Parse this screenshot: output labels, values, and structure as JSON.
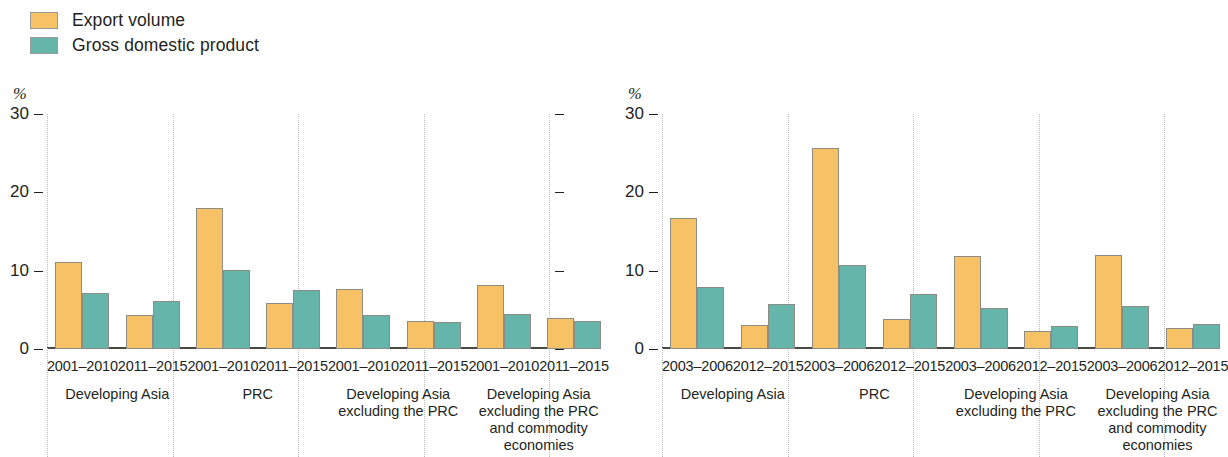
{
  "legend": {
    "items": [
      {
        "label": "Export volume",
        "color": "#f6c265",
        "key": "export_volume"
      },
      {
        "label": "Gross domestic product",
        "color": "#65b5aa",
        "key": "gdp"
      }
    ]
  },
  "chart_data": [
    {
      "type": "bar",
      "panel": "left",
      "title": "",
      "ylabel": "%",
      "xlabel": "",
      "ylim": [
        0,
        30
      ],
      "yticks": [
        0,
        10,
        20,
        30
      ],
      "grid": false,
      "legend_position": "top-left",
      "categories": [
        "Developing Asia",
        "PRC",
        "Developing Asia excluding the PRC",
        "Developing Asia excluding the PRC and commodity economies"
      ],
      "periods": [
        "2001–2010",
        "2011–2015"
      ],
      "series": [
        {
          "name": "Export volume",
          "values": [
            11.1,
            4.4,
            18.0,
            5.9,
            7.7,
            3.6,
            8.2,
            3.9
          ]
        },
        {
          "name": "Gross domestic product",
          "values": [
            7.2,
            6.1,
            10.1,
            7.5,
            4.3,
            3.4,
            4.5,
            3.6
          ]
        }
      ]
    },
    {
      "type": "bar",
      "panel": "right",
      "title": "",
      "ylabel": "%",
      "xlabel": "",
      "ylim": [
        0,
        30
      ],
      "yticks": [
        0,
        10,
        20,
        30
      ],
      "grid": false,
      "legend_position": "top-left",
      "categories": [
        "Developing Asia",
        "PRC",
        "Developing Asia excluding the PRC",
        "Developing Asia excluding the PRC and commodity economies"
      ],
      "periods": [
        "2003–2006",
        "2012–2015"
      ],
      "series": [
        {
          "name": "Export volume",
          "values": [
            16.7,
            3.1,
            25.7,
            3.8,
            11.9,
            2.3,
            12.0,
            2.7
          ]
        },
        {
          "name": "Gross domestic product",
          "values": [
            7.9,
            5.8,
            10.7,
            7.0,
            5.2,
            2.9,
            5.5,
            3.2
          ]
        }
      ]
    }
  ]
}
